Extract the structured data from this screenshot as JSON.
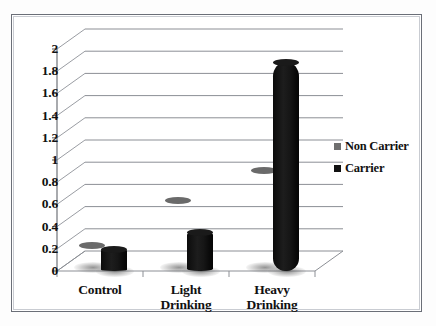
{
  "chart_data": {
    "type": "bar",
    "title": "",
    "subtitle": "",
    "xlabel": "",
    "ylabel": "",
    "categories": [
      "Control",
      "Light Drinking",
      "Heavy Drinking"
    ],
    "category_lines": [
      [
        "Control"
      ],
      [
        "Light",
        "Drinking"
      ],
      [
        "Heavy",
        "Drinking"
      ]
    ],
    "series": [
      {
        "name": "Non Carrier",
        "color": "#6f6f6f",
        "values": [
          0.2,
          0.6,
          0.87
        ]
      },
      {
        "name": "Carrier",
        "color": "#111111",
        "values": [
          0.2,
          0.35,
          1.88
        ]
      }
    ],
    "ylim": [
      0,
      2
    ],
    "ytick_step": 0.2,
    "ytick_labels": [
      "2",
      "1.8",
      "1.6",
      "1.4",
      "1.2",
      "1",
      "0.8",
      "0.6",
      "0.4",
      "0.2",
      "0"
    ],
    "ytick_values": [
      2,
      1.8,
      1.6,
      1.4,
      1.2,
      1,
      0.8,
      0.6,
      0.4,
      0.2,
      0
    ],
    "grid": true,
    "grid_axis": "y",
    "three_d": true,
    "bar_shape": "cylinder",
    "legend_position": "right",
    "legend_entries": [
      "Non Carrier",
      "Carrier"
    ],
    "frame_border_color": "#6b6f78",
    "background_color": "#ffffff"
  }
}
